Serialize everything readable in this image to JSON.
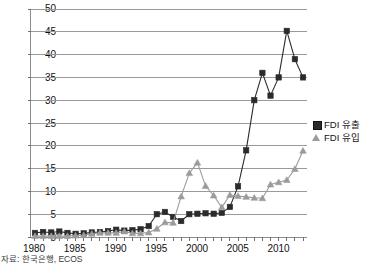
{
  "chart_data": {
    "type": "line",
    "title": "",
    "subtitle": "",
    "xlabel": "",
    "ylabel": "",
    "grid": "horizontal",
    "legend_position": "right",
    "xlim": [
      1980,
      2013
    ],
    "ylim": [
      0,
      50
    ],
    "ytick_step": 5,
    "x": [
      1980,
      1981,
      1982,
      1983,
      1984,
      1985,
      1986,
      1987,
      1988,
      1989,
      1990,
      1991,
      1992,
      1993,
      1994,
      1995,
      1996,
      1997,
      1998,
      1999,
      2000,
      2001,
      2002,
      2003,
      2004,
      2005,
      2006,
      2007,
      2008,
      2009,
      2010,
      2011,
      2012,
      2013
    ],
    "xtick_labels": [
      "1980",
      "1985",
      "1990",
      "1995",
      "2000",
      "2005",
      "2010"
    ],
    "ytick_labels": [
      "0",
      "5",
      "10",
      "15",
      "20",
      "25",
      "30",
      "35",
      "40",
      "45",
      "50"
    ],
    "series": [
      {
        "name": "FDI 유출",
        "marker": "square",
        "color": "#2b2b2b",
        "values": [
          0.9,
          1.1,
          1.0,
          1.2,
          0.9,
          0.7,
          0.8,
          1.0,
          1.1,
          1.3,
          1.6,
          1.4,
          1.5,
          1.7,
          2.4,
          5.0,
          5.5,
          4.4,
          3.5,
          5.0,
          5.1,
          5.2,
          5.1,
          5.3,
          6.6,
          11.1,
          19.0,
          30.0,
          36.0,
          31.0,
          35.0,
          45.2,
          39.0,
          35.0
        ]
      },
      {
        "name": "FDI 유입",
        "marker": "triangle",
        "color": "#9b9b9b",
        "values": [
          0.2,
          0.2,
          0.2,
          0.2,
          0.2,
          0.3,
          0.4,
          0.7,
          0.9,
          0.9,
          0.9,
          1.2,
          0.8,
          0.8,
          1.0,
          1.8,
          3.2,
          3.1,
          8.9,
          14.0,
          16.3,
          11.2,
          9.1,
          6.5,
          9.2,
          9.0,
          8.8,
          8.6,
          8.5,
          11.5,
          12.0,
          12.5,
          14.9,
          18.9
        ]
      }
    ]
  },
  "legend": {
    "entries": [
      {
        "label": "FDI 유출",
        "marker": "square-marker",
        "color": "#2b2b2b"
      },
      {
        "label": "FDI 유입",
        "marker": "triangle-marker",
        "color": "#9b9b9b"
      }
    ]
  },
  "caption": {
    "source_text": "자료: 한국은행, ECOS"
  }
}
